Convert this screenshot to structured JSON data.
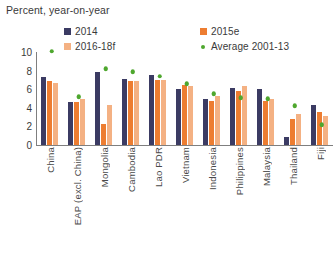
{
  "chart_data": {
    "type": "bar",
    "title": "Percent, year-on-year",
    "xlabel": "",
    "ylabel": "",
    "ylim": [
      0,
      10
    ],
    "yticks": [
      10,
      8,
      6,
      4,
      2,
      0
    ],
    "grid": false,
    "legend_position": "top",
    "categories": [
      "China",
      "EAP (excl. China)",
      "Mongolia",
      "Cambodia",
      "Lao PDR",
      "Vietnam",
      "Indonesia",
      "Philippines",
      "Malaysia",
      "Thailand",
      "Fiji"
    ],
    "series": [
      {
        "name": "2014",
        "type": "bar",
        "color": "#3B3B63",
        "values": [
          7.3,
          4.6,
          7.8,
          7.1,
          7.5,
          6.0,
          5.0,
          6.1,
          6.0,
          0.9,
          4.3
        ]
      },
      {
        "name": "2015e",
        "type": "bar",
        "color": "#ED7D31",
        "values": [
          6.9,
          4.6,
          2.3,
          6.9,
          7.0,
          6.5,
          4.7,
          5.8,
          4.7,
          2.8,
          3.5
        ]
      },
      {
        "name": "2016-18f",
        "type": "bar",
        "color": "#F4B183",
        "values": [
          6.7,
          4.9,
          4.3,
          6.9,
          7.0,
          6.3,
          5.3,
          6.3,
          4.9,
          3.3,
          3.1
        ]
      },
      {
        "name": "Average 2001-13",
        "type": "scatter",
        "color": "#4EA72E",
        "values": [
          10.1,
          5.2,
          8.2,
          7.9,
          7.4,
          6.6,
          5.5,
          5.1,
          5.0,
          4.2,
          2.2
        ]
      }
    ]
  },
  "legend": {
    "entries": [
      {
        "label": "2014",
        "marker": "square"
      },
      {
        "label": "2015e",
        "marker": "square"
      },
      {
        "label": "2016-18f",
        "marker": "square"
      },
      {
        "label": "Average 2001-13",
        "marker": "dot"
      }
    ]
  }
}
